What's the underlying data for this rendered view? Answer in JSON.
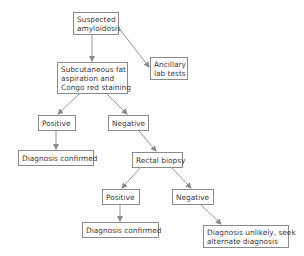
{
  "diagram": {
    "type": "flowchart",
    "nodes": {
      "suspected": {
        "line1": "Suspected",
        "line2": "amyloidosis"
      },
      "fat_aspiration": {
        "line1": "Subcutaneous fat",
        "line2": "aspiration and",
        "line3": "Congo red staining"
      },
      "ancillary": {
        "line1": "Ancillary",
        "line2": "lab tests"
      },
      "positive_1": {
        "label": "Positive"
      },
      "negative_1": {
        "label": "Negative"
      },
      "confirmed_1": {
        "label": "Diagnosis confirmed"
      },
      "rectal_biopsy": {
        "label": "Rectal biopsy"
      },
      "positive_2": {
        "label": "Positive"
      },
      "negative_2": {
        "label": "Negative"
      },
      "confirmed_2": {
        "label": "Diagnosis confirmed"
      },
      "unlikely": {
        "line1": "Diagnosis unlikely, seek",
        "line2": "alternate diagnosis"
      }
    },
    "edges": [
      {
        "from": "Suspected amyloidosis",
        "to": "Subcutaneous fat aspiration and Congo red staining"
      },
      {
        "from": "Suspected amyloidosis",
        "to": "Ancillary lab tests"
      },
      {
        "from": "Subcutaneous fat aspiration and Congo red staining",
        "to": "Positive"
      },
      {
        "from": "Subcutaneous fat aspiration and Congo red staining",
        "to": "Negative"
      },
      {
        "from": "Positive",
        "to": "Diagnosis confirmed"
      },
      {
        "from": "Negative",
        "to": "Rectal biopsy"
      },
      {
        "from": "Rectal biopsy",
        "to": "Positive"
      },
      {
        "from": "Rectal biopsy",
        "to": "Negative"
      },
      {
        "from": "Positive",
        "to": "Diagnosis confirmed"
      },
      {
        "from": "Negative",
        "to": "Diagnosis unlikely, seek alternate diagnosis"
      }
    ],
    "colors": {
      "border": "#8a8a8a",
      "text": "#3a3a3a",
      "arrow": "#8a8a8a",
      "background": "#ffffff"
    }
  }
}
